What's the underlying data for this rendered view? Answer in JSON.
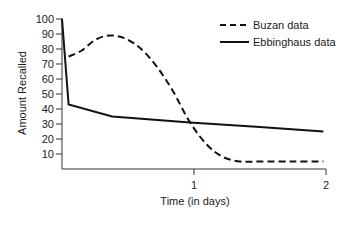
{
  "chart_data": {
    "type": "line",
    "title": "",
    "xlabel": "Time (in days)",
    "ylabel": "Amount Recalled",
    "xlim": [
      0,
      2
    ],
    "ylim": [
      0,
      100
    ],
    "x_ticks": [
      1,
      2
    ],
    "x_tick_labels": [
      "1",
      "2"
    ],
    "y_ticks": [
      10,
      20,
      30,
      40,
      50,
      60,
      70,
      80,
      90,
      100
    ],
    "y_tick_labels": [
      "10",
      "20",
      "30",
      "40",
      "50",
      "60",
      "70",
      "80",
      "90",
      "100"
    ],
    "grid": false,
    "legend_position": "top-right",
    "series": [
      {
        "name": "Buzan data",
        "style": "dashed",
        "color": "#111111",
        "x": [
          0.05,
          0.15,
          0.25,
          0.36,
          0.48,
          0.6,
          0.72,
          0.84,
          0.97,
          1.1,
          1.22,
          1.35,
          1.5,
          1.75,
          1.98
        ],
        "y": [
          75,
          79,
          86,
          89,
          87,
          80,
          68,
          52,
          31,
          16,
          8,
          5,
          5,
          5,
          5
        ]
      },
      {
        "name": "Ebbinghaus data",
        "style": "solid",
        "color": "#111111",
        "x": [
          0,
          0.05,
          0.38,
          0.97,
          1.5,
          1.98
        ],
        "y": [
          100,
          43,
          35,
          31,
          28,
          25
        ]
      }
    ]
  },
  "legend": {
    "items": [
      {
        "label": "Buzan data",
        "style": "dashed"
      },
      {
        "label": "Ebbinghaus data",
        "style": "solid"
      }
    ]
  }
}
